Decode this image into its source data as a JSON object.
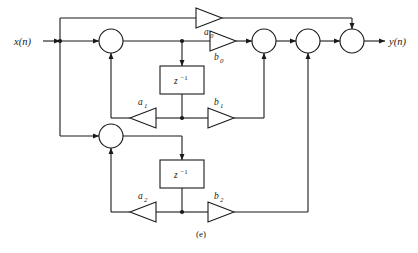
{
  "figure": {
    "caption": "(e)",
    "type": "signal-flow-graph"
  },
  "io": {
    "input_label": "x(n)",
    "output_label": "y(n)"
  },
  "delays": [
    {
      "id": "delay-1",
      "base": "z",
      "exponent": "−1"
    },
    {
      "id": "delay-2",
      "base": "z",
      "exponent": "−1"
    }
  ],
  "gains": [
    {
      "id": "gain-a0",
      "base": "a",
      "sub": "0",
      "direction": "right"
    },
    {
      "id": "gain-b0",
      "base": "b",
      "sub": "0",
      "direction": "right"
    },
    {
      "id": "gain-a1",
      "base": "a",
      "sub": "1",
      "direction": "left"
    },
    {
      "id": "gain-b1",
      "base": "b",
      "sub": "1",
      "direction": "right"
    },
    {
      "id": "gain-a2",
      "base": "a",
      "sub": "2",
      "direction": "left"
    },
    {
      "id": "gain-b2",
      "base": "b",
      "sub": "2",
      "direction": "right"
    }
  ],
  "adders": [
    {
      "id": "adder-1",
      "role": "feedback-sum-stage-1"
    },
    {
      "id": "adder-2",
      "role": "feedback-sum-stage-2"
    },
    {
      "id": "adder-3",
      "role": "output-sum-b0-b1"
    },
    {
      "id": "adder-4",
      "role": "output-sum-b2"
    },
    {
      "id": "adder-5",
      "role": "output-sum-a0"
    }
  ],
  "colors": {
    "line": "#1a1a1a",
    "fill": "#ffffff",
    "background": "#ffffff"
  }
}
